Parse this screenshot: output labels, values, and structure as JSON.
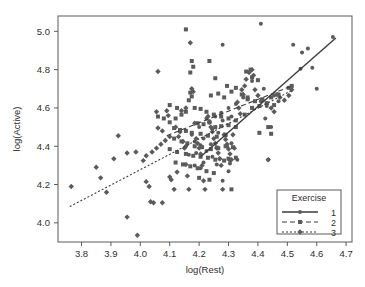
{
  "chart_data": {
    "type": "scatter",
    "title": "",
    "xlabel": "log(Rest)",
    "ylabel": "log(Active)",
    "xlim": [
      3.72,
      4.72
    ],
    "ylim": [
      3.9,
      5.08
    ],
    "grid": false,
    "xticks": [
      "3.8",
      "3.9",
      "4.0",
      "4.1",
      "4.2",
      "4.3",
      "4.4",
      "4.5",
      "4.6",
      "4.7"
    ],
    "xtick_values": [
      3.8,
      3.9,
      4.0,
      4.1,
      4.2,
      4.3,
      4.4,
      4.5,
      4.6,
      4.7
    ],
    "yticks": [
      "4.0",
      "4.2",
      "4.4",
      "4.6",
      "4.8",
      "5.0"
    ],
    "ytick_values": [
      4.0,
      4.2,
      4.4,
      4.6,
      4.8,
      5.0
    ],
    "legend": {
      "title": "Exercise",
      "position": "bottom-right",
      "entries": [
        {
          "label": "1",
          "marker": "circle",
          "line": "solid",
          "color": "#3b3b3b"
        },
        {
          "label": "2",
          "marker": "square",
          "line": "dashed",
          "color": "#3b3b3b"
        },
        {
          "label": "3",
          "marker": "diamond",
          "line": "dotted",
          "color": "#3b3b3b"
        }
      ]
    },
    "series": [
      {
        "name": "1",
        "marker": "circle",
        "color": "#5b5b5b",
        "fit": {
          "style": "solid",
          "x": [
            4.205,
            4.665
          ],
          "y": [
            4.345,
            4.965
          ]
        },
        "points": [
          [
            4.41,
            5.04
          ],
          [
            4.28,
            4.93
          ],
          [
            4.52,
            4.93
          ],
          [
            4.55,
            4.89
          ],
          [
            4.57,
            4.91
          ],
          [
            4.655,
            4.97
          ],
          [
            4.545,
            4.805
          ],
          [
            4.585,
            4.81
          ],
          [
            4.38,
            4.74
          ],
          [
            4.42,
            4.7
          ],
          [
            4.6,
            4.7
          ],
          [
            4.455,
            4.665
          ],
          [
            4.35,
            4.655
          ],
          [
            4.41,
            4.635
          ],
          [
            4.325,
            4.62
          ],
          [
            4.3,
            4.6
          ],
          [
            4.47,
            4.635
          ],
          [
            4.43,
            4.61
          ],
          [
            4.275,
            4.575
          ],
          [
            4.255,
            4.555
          ],
          [
            4.235,
            4.53
          ],
          [
            4.225,
            4.545
          ],
          [
            4.28,
            4.535
          ],
          [
            4.31,
            4.555
          ],
          [
            4.2,
            4.5
          ],
          [
            4.245,
            4.49
          ],
          [
            4.265,
            4.47
          ],
          [
            4.29,
            4.455
          ],
          [
            4.175,
            4.46
          ],
          [
            4.215,
            4.44
          ],
          [
            4.185,
            4.425
          ],
          [
            4.155,
            4.4
          ],
          [
            4.205,
            4.405
          ],
          [
            4.24,
            4.41
          ],
          [
            4.26,
            4.395
          ],
          [
            4.295,
            4.4
          ],
          [
            4.31,
            4.415
          ],
          [
            4.225,
            4.375
          ],
          [
            4.19,
            4.365
          ],
          [
            4.165,
            4.355
          ],
          [
            4.245,
            4.345
          ],
          [
            4.27,
            4.335
          ],
          [
            4.305,
            4.325
          ],
          [
            4.215,
            4.315
          ],
          [
            4.185,
            4.3
          ],
          [
            4.305,
            4.31
          ],
          [
            4.425,
            4.545
          ],
          [
            4.445,
            4.5
          ],
          [
            4.28,
            4.22
          ],
          [
            4.435,
            4.33
          ],
          [
            4.33,
            4.33
          ],
          [
            4.26,
            4.305
          ],
          [
            4.205,
            4.285
          ],
          [
            4.3,
            4.27
          ]
        ]
      },
      {
        "name": "2",
        "marker": "square",
        "color": "#5b5b5b",
        "fit": {
          "style": "dashed",
          "x": [
            4.09,
            4.515
          ],
          "y": [
            4.455,
            4.715
          ]
        },
        "points": [
          [
            4.155,
            5.01
          ],
          [
            4.175,
            4.845
          ],
          [
            4.18,
            4.815
          ],
          [
            4.17,
            4.785
          ],
          [
            4.235,
            4.845
          ],
          [
            4.255,
            4.755
          ],
          [
            4.36,
            4.79
          ],
          [
            4.375,
            4.8
          ],
          [
            4.38,
            4.76
          ],
          [
            4.4,
            4.745
          ],
          [
            4.295,
            4.715
          ],
          [
            4.325,
            4.705
          ],
          [
            4.31,
            4.685
          ],
          [
            4.17,
            4.68
          ],
          [
            4.175,
            4.66
          ],
          [
            4.165,
            4.64
          ],
          [
            4.24,
            4.665
          ],
          [
            4.265,
            4.675
          ],
          [
            4.285,
            4.655
          ],
          [
            4.345,
            4.67
          ],
          [
            4.365,
            4.655
          ],
          [
            4.39,
            4.635
          ],
          [
            4.415,
            4.645
          ],
          [
            4.445,
            4.655
          ],
          [
            4.47,
            4.67
          ],
          [
            4.505,
            4.705
          ],
          [
            4.515,
            4.715
          ],
          [
            4.185,
            4.6
          ],
          [
            4.205,
            4.595
          ],
          [
            4.225,
            4.58
          ],
          [
            4.155,
            4.58
          ],
          [
            4.14,
            4.565
          ],
          [
            4.12,
            4.545
          ],
          [
            4.1,
            4.525
          ],
          [
            4.08,
            4.545
          ],
          [
            4.06,
            4.555
          ],
          [
            4.25,
            4.565
          ],
          [
            4.275,
            4.555
          ],
          [
            4.3,
            4.545
          ],
          [
            4.325,
            4.535
          ],
          [
            4.355,
            4.565
          ],
          [
            4.38,
            4.6
          ],
          [
            4.405,
            4.61
          ],
          [
            4.43,
            4.625
          ],
          [
            4.455,
            4.615
          ],
          [
            4.195,
            4.52
          ],
          [
            4.215,
            4.515
          ],
          [
            4.235,
            4.525
          ],
          [
            4.255,
            4.5
          ],
          [
            4.275,
            4.505
          ],
          [
            4.3,
            4.51
          ],
          [
            4.325,
            4.5
          ],
          [
            4.115,
            4.495
          ],
          [
            4.135,
            4.485
          ],
          [
            4.155,
            4.48
          ],
          [
            4.175,
            4.47
          ],
          [
            4.205,
            4.465
          ],
          [
            4.23,
            4.455
          ],
          [
            4.26,
            4.45
          ],
          [
            4.29,
            4.46
          ],
          [
            4.115,
            4.44
          ],
          [
            4.14,
            4.425
          ],
          [
            4.16,
            4.415
          ],
          [
            4.185,
            4.4
          ],
          [
            4.21,
            4.395
          ],
          [
            4.24,
            4.385
          ],
          [
            4.265,
            4.39
          ],
          [
            4.29,
            4.4
          ],
          [
            4.315,
            4.395
          ],
          [
            4.1,
            4.385
          ],
          [
            4.125,
            4.37
          ],
          [
            4.155,
            4.36
          ],
          [
            4.18,
            4.35
          ],
          [
            4.205,
            4.345
          ],
          [
            4.23,
            4.34
          ],
          [
            4.255,
            4.33
          ],
          [
            4.285,
            4.325
          ],
          [
            4.12,
            4.315
          ],
          [
            4.145,
            4.305
          ],
          [
            4.17,
            4.295
          ],
          [
            4.195,
            4.285
          ],
          [
            4.225,
            4.27
          ],
          [
            4.25,
            4.26
          ],
          [
            4.3,
            4.335
          ],
          [
            4.325,
            4.34
          ],
          [
            4.2,
            4.235
          ],
          [
            4.235,
            4.225
          ],
          [
            4.31,
            4.175
          ],
          [
            4.435,
            4.5
          ],
          [
            4.405,
            4.47
          ],
          [
            4.445,
            4.465
          ],
          [
            4.365,
            4.645
          ],
          [
            4.1,
            4.615
          ],
          [
            4.125,
            4.6
          ]
        ]
      },
      {
        "name": "3",
        "marker": "diamond",
        "color": "#5b5b5b",
        "fit": {
          "style": "dotted",
          "x": [
            3.76,
            4.52
          ],
          "y": [
            4.085,
            4.695
          ]
        },
        "points": [
          [
            3.765,
            4.19
          ],
          [
            3.85,
            4.29
          ],
          [
            3.865,
            4.235
          ],
          [
            3.885,
            4.16
          ],
          [
            3.91,
            4.335
          ],
          [
            3.925,
            4.455
          ],
          [
            3.955,
            4.365
          ],
          [
            3.985,
            4.37
          ],
          [
            3.955,
            4.03
          ],
          [
            3.99,
            3.935
          ],
          [
            4.01,
            4.325
          ],
          [
            4.02,
            4.215
          ],
          [
            4.03,
            4.19
          ],
          [
            4.035,
            4.11
          ],
          [
            4.045,
            4.105
          ],
          [
            4.06,
            4.79
          ],
          [
            4.055,
            4.58
          ],
          [
            4.06,
            4.495
          ],
          [
            4.075,
            4.48
          ],
          [
            4.075,
            4.105
          ],
          [
            4.09,
            4.585
          ],
          [
            4.095,
            4.56
          ],
          [
            4.1,
            4.24
          ],
          [
            4.105,
            4.225
          ],
          [
            4.115,
            4.175
          ],
          [
            4.125,
            4.265
          ],
          [
            4.13,
            4.45
          ],
          [
            4.14,
            4.585
          ],
          [
            4.155,
            4.6
          ],
          [
            4.145,
            4.425
          ],
          [
            4.15,
            4.39
          ],
          [
            4.155,
            4.305
          ],
          [
            4.16,
            4.245
          ],
          [
            4.165,
            4.175
          ],
          [
            4.17,
            4.94
          ],
          [
            4.175,
            4.7
          ],
          [
            4.18,
            4.685
          ],
          [
            4.185,
            4.52
          ],
          [
            4.19,
            4.44
          ],
          [
            4.195,
            4.415
          ],
          [
            4.2,
            4.39
          ],
          [
            4.205,
            4.36
          ],
          [
            4.21,
            4.3
          ],
          [
            4.215,
            4.22
          ],
          [
            4.22,
            4.175
          ],
          [
            4.23,
            4.555
          ],
          [
            4.235,
            4.525
          ],
          [
            4.24,
            4.5
          ],
          [
            4.245,
            4.475
          ],
          [
            4.25,
            4.44
          ],
          [
            4.255,
            4.415
          ],
          [
            4.26,
            4.39
          ],
          [
            4.265,
            4.365
          ],
          [
            4.27,
            4.335
          ],
          [
            4.275,
            4.3
          ],
          [
            4.28,
            4.175
          ],
          [
            4.285,
            4.46
          ],
          [
            4.29,
            4.435
          ],
          [
            4.295,
            4.41
          ],
          [
            4.3,
            4.385
          ],
          [
            4.305,
            4.36
          ],
          [
            4.31,
            4.33
          ],
          [
            4.315,
            4.46
          ],
          [
            4.32,
            4.39
          ],
          [
            4.33,
            4.63
          ],
          [
            4.335,
            4.6
          ],
          [
            4.34,
            4.57
          ],
          [
            4.345,
            4.695
          ],
          [
            4.35,
            4.67
          ],
          [
            4.355,
            4.715
          ],
          [
            4.36,
            4.75
          ],
          [
            4.37,
            4.785
          ],
          [
            4.38,
            4.8
          ],
          [
            4.385,
            4.77
          ],
          [
            4.39,
            4.695
          ],
          [
            4.4,
            4.665
          ],
          [
            4.415,
            4.64
          ],
          [
            4.43,
            4.62
          ],
          [
            4.435,
            4.33
          ],
          [
            4.445,
            4.6
          ],
          [
            4.455,
            4.58
          ],
          [
            4.465,
            4.67
          ],
          [
            4.475,
            4.655
          ],
          [
            4.49,
            4.64
          ],
          [
            4.505,
            4.665
          ],
          [
            4.515,
            4.695
          ],
          [
            4.12,
            4.5
          ],
          [
            4.135,
            4.475
          ],
          [
            4.1,
            4.45
          ],
          [
            4.085,
            4.43
          ],
          [
            4.07,
            4.41
          ],
          [
            4.055,
            4.39
          ],
          [
            4.04,
            4.37
          ],
          [
            4.02,
            4.35
          ]
        ]
      }
    ]
  }
}
